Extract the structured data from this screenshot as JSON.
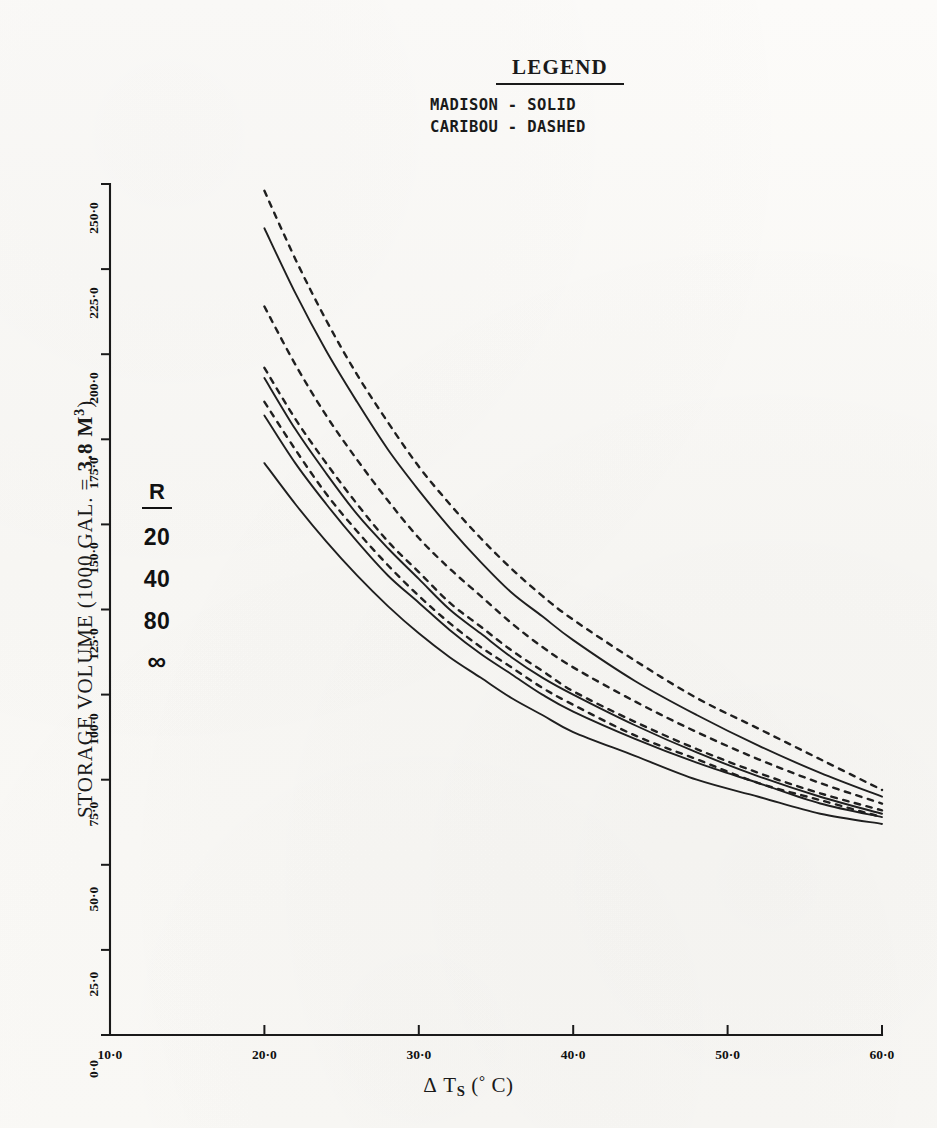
{
  "legend": {
    "title": "LEGEND",
    "entries": [
      "MADISON - SOLID",
      "CARIBOU - DASHED"
    ]
  },
  "axes": {
    "y_title_prefix": "STORAGE VOLUME (1000 GAL. =",
    "y_title_bold": "3.8 M",
    "y_title_sup": "3",
    "y_title_suffix": ")",
    "x_title_delta": "Δ",
    "x_title_var": "T",
    "x_title_sub": "S",
    "x_title_unit_open": "(",
    "x_title_deg": "°",
    "x_title_unit": " C",
    "x_title_unit_close": ")",
    "y_ticks": [
      "0·0",
      "25·0",
      "50·0",
      "75·0",
      "100·0",
      "125·0",
      "150·0",
      "175·0",
      "200·0",
      "225·0",
      "250·0"
    ],
    "x_ticks": [
      "10·0",
      "20·0",
      "30·0",
      "40·0",
      "50·0",
      "60·0"
    ]
  },
  "r_block": {
    "header": "R",
    "values": [
      "20",
      "40",
      "80",
      "∞"
    ]
  },
  "chart_data": {
    "type": "line",
    "title": "",
    "xlabel": "Δ T_S (° C)",
    "ylabel": "STORAGE VOLUME (1000 GAL. = 3.8 M3)",
    "xlim": [
      10.0,
      60.0
    ],
    "ylim": [
      0.0,
      250.0
    ],
    "xticks": [
      10.0,
      20.0,
      30.0,
      40.0,
      50.0,
      60.0
    ],
    "yticks": [
      0.0,
      25.0,
      50.0,
      75.0,
      100.0,
      125.0,
      150.0,
      175.0,
      200.0,
      225.0,
      250.0
    ],
    "grid": false,
    "legend_position": "top-center",
    "legend_entries": [
      "MADISON - SOLID",
      "CARIBOU - DASHED"
    ],
    "parameter_name": "R",
    "parameter_values": [
      "20",
      "40",
      "80",
      "∞"
    ],
    "x": [
      20,
      22,
      24,
      26,
      28,
      30,
      32,
      34,
      36,
      38,
      40,
      44,
      48,
      52,
      56,
      60
    ],
    "series": [
      {
        "name": "CARIBOU R=20",
        "location": "CARIBOU",
        "R": "20",
        "style": "dashed",
        "values": [
          248,
          228,
          210,
          194,
          180,
          167,
          156,
          146,
          137,
          129,
          122,
          110,
          99,
          90,
          81,
          72
        ]
      },
      {
        "name": "MADISON R=20",
        "location": "MADISON",
        "R": "20",
        "style": "solid",
        "values": [
          237,
          218,
          201,
          186,
          172,
          160,
          149,
          139,
          130,
          123,
          116,
          104,
          94,
          85,
          77,
          70
        ]
      },
      {
        "name": "CARIBOU R=40",
        "location": "CARIBOU",
        "R": "40",
        "style": "dashed",
        "values": [
          214,
          197,
          182,
          169,
          157,
          146,
          137,
          129,
          121,
          114,
          108,
          98,
          89,
          81,
          74,
          68
        ]
      },
      {
        "name": "CARIBOU R=80",
        "location": "CARIBOU",
        "R": "80",
        "style": "dashed",
        "values": [
          196,
          181,
          168,
          156,
          145,
          136,
          127,
          120,
          113,
          107,
          101,
          92,
          84,
          77,
          71,
          66
        ]
      },
      {
        "name": "MADISON R=40",
        "location": "MADISON",
        "R": "40",
        "style": "solid",
        "values": [
          193,
          178,
          165,
          153,
          143,
          134,
          125,
          118,
          111,
          105,
          100,
          91,
          83,
          76,
          70,
          65
        ]
      },
      {
        "name": "CARIBOU R=inf",
        "location": "CARIBOU",
        "R": "∞",
        "style": "dashed",
        "values": [
          186,
          172,
          159,
          148,
          138,
          129,
          121,
          114,
          108,
          102,
          97,
          88,
          81,
          74,
          69,
          64
        ]
      },
      {
        "name": "MADISON R=80",
        "location": "MADISON",
        "R": "80",
        "style": "solid",
        "values": [
          182,
          168,
          156,
          145,
          135,
          127,
          119,
          112,
          106,
          100,
          95,
          87,
          80,
          74,
          68,
          64
        ]
      },
      {
        "name": "MADISON R=inf",
        "location": "MADISON",
        "R": "∞",
        "style": "solid",
        "values": [
          168,
          156,
          145,
          135,
          126,
          118,
          111,
          105,
          99,
          94,
          89,
          82,
          75,
          70,
          65,
          62
        ]
      }
    ]
  }
}
